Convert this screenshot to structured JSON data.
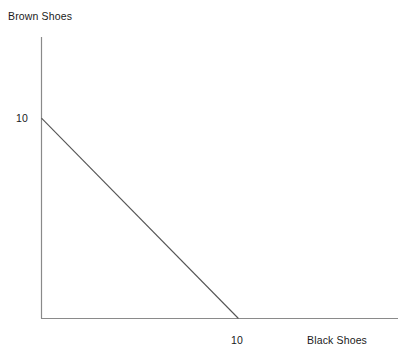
{
  "chart_data": {
    "type": "line",
    "title": "",
    "xlabel": "Black Shoes",
    "ylabel": "Brown Shoes",
    "xlim": [
      0,
      18.1
    ],
    "ylim": [
      0,
      14.05
    ],
    "grid": false,
    "legend": null,
    "x_tick_labels": [
      "10"
    ],
    "x_ticks": [
      10
    ],
    "y_tick_labels": [
      "10"
    ],
    "y_ticks": [
      10
    ],
    "series": [
      {
        "name": "budget-constraint",
        "x": [
          0,
          10
        ],
        "values": [
          10,
          0
        ],
        "color": "#555555"
      }
    ],
    "annotations": []
  },
  "axes": {
    "y_title": "Brown Shoes",
    "x_title": "Black Shoes",
    "y_tick_10": "10",
    "x_tick_10": "10"
  },
  "style": {
    "axis_color": "#8a8a8a",
    "line_color": "#555555",
    "text_color": "#1a1a1a",
    "background": "#ffffff"
  }
}
